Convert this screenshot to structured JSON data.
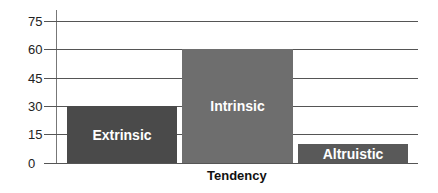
{
  "chart_data": {
    "type": "bar",
    "title": "",
    "xlabel": "Tendency",
    "ylabel": "",
    "categories": [
      "Extrinsic",
      "Intrinsic",
      "Altruistic"
    ],
    "values": [
      30,
      60,
      10
    ],
    "ylim": [
      0,
      75
    ],
    "yticks": [
      "75",
      "60",
      "45",
      "30",
      "15",
      "0"
    ],
    "grid": true,
    "legend": "none",
    "bar_colors": [
      "#4a4a4a",
      "#6e6e6e",
      "#595959"
    ],
    "bar_labels_inside": true
  }
}
